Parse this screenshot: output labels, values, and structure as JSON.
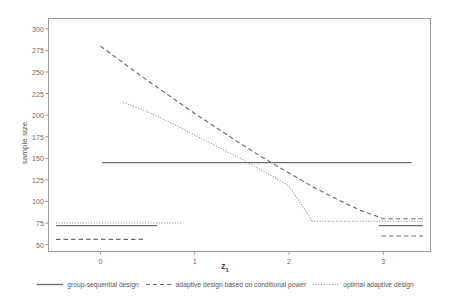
{
  "chart_data": {
    "type": "line",
    "title": "",
    "xlabel": "z₁",
    "ylabel": "sample size",
    "xlim": [
      -0.55,
      3.5
    ],
    "ylim": [
      42,
      312
    ],
    "xticks": [
      0,
      1,
      2,
      3
    ],
    "xtick_labels": [
      "0",
      "1",
      "2",
      "3"
    ],
    "yticks": [
      50,
      75,
      100,
      125,
      150,
      175,
      200,
      225,
      250,
      275,
      300
    ],
    "ytick_labels": [
      "50",
      "75",
      "100",
      "125",
      "150",
      "175",
      "200",
      "225",
      "250",
      "275",
      "300"
    ],
    "grid": false,
    "legend_position": "bottom",
    "frame_color": "#9a9a9a",
    "series": [
      {
        "name": "group-sequential design",
        "style": "solid",
        "color": "#6e6e6e",
        "segments": [
          {
            "x": [
              -0.47,
              0.6
            ],
            "y": [
              72,
              72
            ]
          },
          {
            "x": [
              0.02,
              3.3
            ],
            "y": [
              145,
              145
            ]
          },
          {
            "x": [
              2.95,
              3.42
            ],
            "y": [
              72,
              72
            ]
          }
        ]
      },
      {
        "name": "adaptive design based on conditional power",
        "style": "dashed",
        "color": "#6e6e6e",
        "x": [
          0.0,
          0.25,
          0.5,
          0.75,
          1.0,
          1.25,
          1.5,
          1.75,
          2.0,
          2.25,
          2.5,
          2.75,
          3.0,
          3.42
        ],
        "y": [
          280,
          260,
          240,
          221,
          202,
          184,
          166,
          149,
          133,
          117,
          103,
          90,
          80,
          80
        ],
        "flat_segment": {
          "x": [
            -0.47,
            0.46
          ],
          "y": [
            56,
            56
          ]
        },
        "tail_segment": {
          "x": [
            2.98,
            3.42
          ],
          "y": [
            60,
            60
          ]
        }
      },
      {
        "name": "optimal adaptive design",
        "style": "dotted",
        "color": "#8a8a8a",
        "x": [
          0.24,
          0.5,
          0.75,
          1.0,
          1.25,
          1.5,
          1.75,
          2.0,
          2.25
        ],
        "y": [
          215,
          204,
          191,
          177,
          163,
          149,
          134,
          118,
          77
        ],
        "flat_segment": {
          "x": [
            -0.47,
            0.88
          ],
          "y": [
            75,
            75
          ]
        },
        "tail_segment": {
          "x": [
            2.24,
            3.42
          ],
          "y": [
            77,
            77
          ]
        }
      }
    ]
  },
  "legend": {
    "entries": [
      {
        "label": "group-sequential design",
        "style": "solid"
      },
      {
        "label": "adaptive design based on conditional power",
        "style": "dashed"
      },
      {
        "label": "optimal adaptive design",
        "style": "dotted"
      }
    ]
  }
}
